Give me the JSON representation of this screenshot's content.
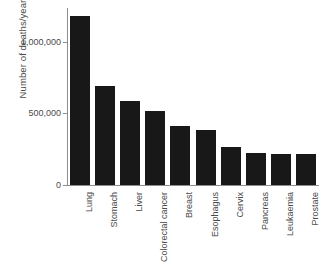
{
  "chart_data": {
    "type": "bar",
    "title": "",
    "subtitle": "",
    "xlabel": "",
    "ylabel": "Number of deaths/year",
    "categories": [
      "Lung",
      "Stomach",
      "Liver",
      "Colorectal cancer",
      "Breast",
      "Esophagus",
      "Cervix",
      "Pancreas",
      "Leukaemia",
      "Prostate"
    ],
    "values": [
      1180000,
      690000,
      590000,
      520000,
      410000,
      385000,
      265000,
      225000,
      220000,
      215000
    ],
    "ylim": [
      0,
      1250000
    ],
    "yticks": [
      0,
      500000,
      1000000
    ],
    "ytick_labels": [
      "0",
      "500,000",
      "1,000,000"
    ],
    "grid": false,
    "legend": "none",
    "bar_color": "#181818",
    "axis_color": "#8d8d8d",
    "text_color": "#4a4a4a",
    "background": "#ffffff"
  }
}
